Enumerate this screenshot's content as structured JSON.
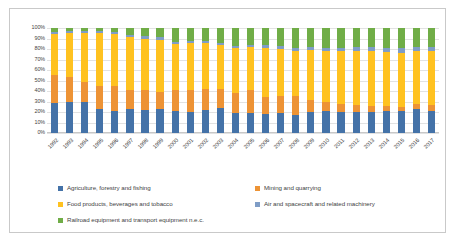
{
  "chart_data": {
    "type": "bar",
    "subtype": "stacked-percentage-column",
    "title": "",
    "subtitle": "",
    "xlabel": "",
    "ylabel": "",
    "ylim": [
      0,
      100
    ],
    "grid": true,
    "legend_position": "bottom",
    "categories": [
      "1992",
      "1993",
      "1994",
      "1995",
      "1996",
      "1997",
      "1998",
      "1999",
      "2000",
      "2001",
      "2002",
      "2003",
      "2004",
      "2005",
      "2006",
      "2007",
      "2008",
      "2009",
      "2010",
      "2011",
      "2012",
      "2013",
      "2014",
      "2015",
      "2016",
      "2017"
    ],
    "y_ticks": [
      "0%",
      "10%",
      "20%",
      "30%",
      "40%",
      "50%",
      "60%",
      "70%",
      "80%",
      "90%",
      "100%"
    ],
    "y_tick_values": [
      0,
      10,
      20,
      30,
      40,
      50,
      60,
      70,
      80,
      90,
      100
    ],
    "series": [
      {
        "name": "Agriculture, forestry and fishing",
        "color": "#4472a8",
        "values": [
          29,
          30,
          30,
          23,
          21,
          23,
          22,
          23,
          21,
          20,
          22,
          24,
          19,
          19,
          18,
          19,
          17,
          20,
          21,
          20,
          20,
          20,
          21,
          21,
          23,
          21
        ]
      },
      {
        "name": "Mining and quarrying",
        "color": "#ed9335",
        "values": [
          26,
          23,
          19,
          22,
          24,
          18,
          19,
          16,
          20,
          21,
          20,
          18,
          19,
          22,
          16,
          16,
          18,
          11,
          9,
          8,
          7,
          6,
          5,
          4,
          5,
          6
        ]
      },
      {
        "name": "Food products, beverages and tobacco",
        "color": "#ffc220",
        "values": [
          39,
          42,
          46,
          50,
          49,
          50,
          49,
          50,
          44,
          45,
          44,
          42,
          43,
          41,
          47,
          45,
          43,
          48,
          48,
          50,
          51,
          52,
          51,
          51,
          50,
          51
        ]
      },
      {
        "name": "Air and spacecraft and related machinery",
        "color": "#7f9dc6",
        "values": [
          2,
          2,
          2,
          2,
          2,
          2,
          2,
          2,
          2,
          2,
          2,
          2,
          2,
          2,
          3,
          3,
          3,
          3,
          3,
          3,
          4,
          4,
          4,
          5,
          4,
          4
        ]
      },
      {
        "name": "Railroad equipment and transport equipment n.e.c.",
        "color": "#70ad47",
        "values": [
          4,
          3,
          3,
          3,
          4,
          7,
          8,
          9,
          13,
          12,
          12,
          14,
          17,
          16,
          16,
          17,
          19,
          18,
          19,
          19,
          18,
          18,
          19,
          19,
          18,
          18
        ]
      }
    ]
  }
}
